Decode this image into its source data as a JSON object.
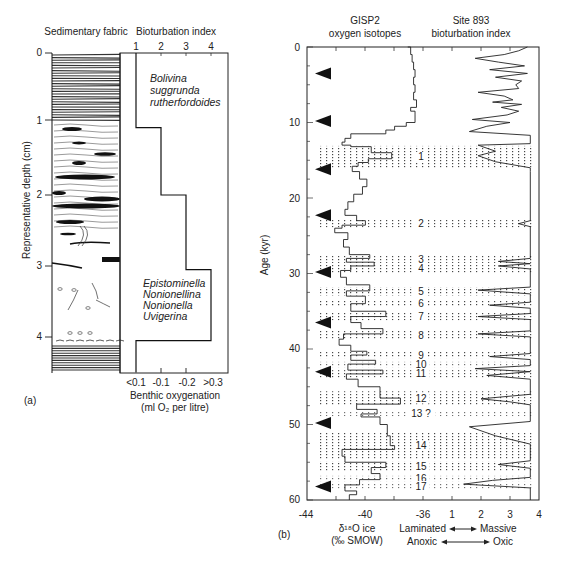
{
  "chart_data": [
    {
      "panel": "(a)",
      "type": "line",
      "columns": {
        "left_header": "Sedimentary fabric",
        "right_header": "Bioturbation index"
      },
      "ylabel": "Representative depth (cm)",
      "y_ticks": [
        "0",
        "1",
        "2",
        "3",
        "4"
      ],
      "ylim": [
        0,
        4.5
      ],
      "top_x_ticks": [
        "1",
        "2",
        "3",
        "4"
      ],
      "bottom_x_ticks": [
        "<0.1",
        "-0.1",
        "-0.2",
        ">0.3"
      ],
      "xlabel_line1": "Benthic oxygenation",
      "xlabel_line2": "(ml O₂ per litre)",
      "bioturbation_step_profile": [
        {
          "depth_from": 0.0,
          "depth_to": 1.05,
          "index": 1
        },
        {
          "depth_from": 1.05,
          "depth_to": 2.0,
          "index": 2
        },
        {
          "depth_from": 2.0,
          "depth_to": 3.05,
          "index": 3
        },
        {
          "depth_from": 3.05,
          "depth_to": 4.05,
          "index": 4
        },
        {
          "depth_from": 4.05,
          "depth_to": 4.5,
          "index": 1
        }
      ],
      "annotations": [
        {
          "text_lines": [
            "Bolivina",
            "suggrunda",
            "rutherfordoides"
          ],
          "depth": 0.4
        },
        {
          "text_lines": [
            "Epistominella",
            "Nonionellina",
            "Nonionella",
            "Uvigerina"
          ],
          "depth": 3.4
        }
      ],
      "panel_label": "(a)"
    },
    {
      "panel": "(b)",
      "type": "line",
      "series": [
        {
          "name": "GISP2 oxygen isotopes",
          "header_line1": "GISP2",
          "header_line2": "oxygen isotopes",
          "unit": "δ¹⁸O ice (‰ SMOW)"
        },
        {
          "name": "Site 893 bioturbation index",
          "header_line1": "Site 893",
          "header_line2": "bioturbation index"
        }
      ],
      "ylabel": "Age (kyr)",
      "y_ticks": [
        "0",
        "10",
        "20",
        "30",
        "40",
        "50",
        "60"
      ],
      "ylim": [
        0,
        60
      ],
      "x_ticks_isotope": [
        "-44",
        "-40",
        "-36"
      ],
      "x_ticks_bioturbation": [
        "1",
        "2",
        "3",
        "4"
      ],
      "xlabel_left_line1": "δ¹⁸O ice",
      "xlabel_left_line2": "(‰ SMOW)",
      "xlabel_right_line1_a": "Laminated",
      "xlabel_right_line1_b": "Massive",
      "xlabel_right_line2_a": "Anoxic",
      "xlabel_right_line2_b": "Oxic",
      "heinrich_arrows_kyr": [
        3.5,
        9.8,
        16.2,
        22.3,
        29.8,
        36.5,
        43.0,
        49.8,
        58.2
      ],
      "interstadial_events": [
        {
          "label": "1",
          "age_from": 13.1,
          "age_to": 16.0
        },
        {
          "label": "2",
          "age_from": 22.8,
          "age_to": 23.9
        },
        {
          "label": "3",
          "age_from": 27.6,
          "age_to": 28.6
        },
        {
          "label": "4",
          "age_from": 28.8,
          "age_to": 29.9
        },
        {
          "label": "5",
          "age_from": 31.8,
          "age_to": 32.9
        },
        {
          "label": "6",
          "age_from": 33.6,
          "age_to": 34.4
        },
        {
          "label": "7",
          "age_from": 35.1,
          "age_to": 36.2
        },
        {
          "label": "8",
          "age_from": 37.5,
          "age_to": 38.8
        },
        {
          "label": "9",
          "age_from": 40.4,
          "age_to": 41.2
        },
        {
          "label": "10",
          "age_from": 41.7,
          "age_to": 42.4
        },
        {
          "label": "11",
          "age_from": 42.8,
          "age_to": 43.8
        },
        {
          "label": "12",
          "age_from": 45.6,
          "age_to": 47.5
        },
        {
          "label": "13 ?",
          "age_from": 48.3,
          "age_to": 48.9
        },
        {
          "label": "14",
          "age_from": 51.0,
          "age_to": 54.6
        },
        {
          "label": "15",
          "age_from": 54.9,
          "age_to": 56.2
        },
        {
          "label": "16",
          "age_from": 56.8,
          "age_to": 57.5
        },
        {
          "label": "17",
          "age_from": 57.8,
          "age_to": 58.5
        }
      ],
      "isotope_curve": [
        [
          0,
          -37.1
        ],
        [
          1,
          -36.9
        ],
        [
          2,
          -36.8
        ],
        [
          3,
          -36.7
        ],
        [
          4,
          -36.6
        ],
        [
          5,
          -36.7
        ],
        [
          6,
          -36.6
        ],
        [
          7,
          -36.7
        ],
        [
          8,
          -36.5
        ],
        [
          8.5,
          -36.9
        ],
        [
          9,
          -36.6
        ],
        [
          10,
          -36.6
        ],
        [
          10.5,
          -37.2
        ],
        [
          11,
          -38.0
        ],
        [
          11.5,
          -38.6
        ],
        [
          12.1,
          -41.0
        ],
        [
          12.6,
          -41.4
        ],
        [
          13.0,
          -41.6
        ],
        [
          13.2,
          -41.0
        ],
        [
          14.0,
          -39.6
        ],
        [
          14.8,
          -38.2
        ],
        [
          15.3,
          -39.8
        ],
        [
          15.8,
          -40.5
        ],
        [
          16.5,
          -40.9
        ],
        [
          17.5,
          -40.4
        ],
        [
          18.5,
          -39.9
        ],
        [
          19.5,
          -40.2
        ],
        [
          20.5,
          -40.8
        ],
        [
          21.5,
          -41.2
        ],
        [
          22.3,
          -41.4
        ],
        [
          23.0,
          -40.6
        ],
        [
          23.6,
          -40.0
        ],
        [
          24.0,
          -41.6
        ],
        [
          24.6,
          -42.1
        ],
        [
          25.5,
          -41.2
        ],
        [
          26.5,
          -41.5
        ],
        [
          27.5,
          -41.1
        ],
        [
          28.0,
          -39.7
        ],
        [
          28.5,
          -41.3
        ],
        [
          29.0,
          -39.4
        ],
        [
          29.6,
          -41.0
        ],
        [
          30.5,
          -41.7
        ],
        [
          31.5,
          -41.3
        ],
        [
          32.3,
          -39.7
        ],
        [
          33.0,
          -41.3
        ],
        [
          34.0,
          -40.0
        ],
        [
          35.0,
          -41.0
        ],
        [
          35.7,
          -38.6
        ],
        [
          36.5,
          -41.0
        ],
        [
          37.3,
          -40.3
        ],
        [
          38.0,
          -38.8
        ],
        [
          38.7,
          -41.5
        ],
        [
          39.5,
          -41.8
        ],
        [
          40.3,
          -41.0
        ],
        [
          40.8,
          -39.9
        ],
        [
          41.5,
          -41.0
        ],
        [
          42.0,
          -39.3
        ],
        [
          42.8,
          -41.2
        ],
        [
          43.3,
          -38.8
        ],
        [
          44.0,
          -41.3
        ],
        [
          45.0,
          -40.5
        ],
        [
          46.5,
          -39.0
        ],
        [
          47.3,
          -37.6
        ],
        [
          48.0,
          -40.6
        ],
        [
          48.6,
          -39.2
        ],
        [
          49.0,
          -40.3
        ],
        [
          50.0,
          -39.0
        ],
        [
          51.5,
          -38.5
        ],
        [
          52.8,
          -38.3
        ],
        [
          53.3,
          -38.0
        ],
        [
          54.2,
          -41.6
        ],
        [
          55.0,
          -41.4
        ],
        [
          55.7,
          -38.6
        ],
        [
          56.5,
          -39.6
        ],
        [
          57.3,
          -39.0
        ],
        [
          58.0,
          -40.4
        ],
        [
          58.8,
          -41.4
        ],
        [
          59.3,
          -40.6
        ],
        [
          60.0,
          -41.1
        ]
      ],
      "bioturbation_curve": [
        [
          0,
          3.6
        ],
        [
          0.5,
          3.3
        ],
        [
          1.0,
          2.8
        ],
        [
          1.5,
          1.8
        ],
        [
          2.0,
          2.6
        ],
        [
          2.5,
          3.5
        ],
        [
          3.0,
          2.3
        ],
        [
          3.5,
          3.6
        ],
        [
          4.0,
          2.5
        ],
        [
          4.5,
          3.4
        ],
        [
          5.0,
          3.2
        ],
        [
          5.5,
          3.3
        ],
        [
          6.0,
          1.9
        ],
        [
          6.5,
          2.8
        ],
        [
          7.0,
          3.1
        ],
        [
          7.3,
          2.4
        ],
        [
          7.6,
          3.4
        ],
        [
          8.0,
          2.7
        ],
        [
          8.5,
          3.3
        ],
        [
          9.0,
          2.9
        ],
        [
          9.6,
          1.7
        ],
        [
          10.0,
          3.0
        ],
        [
          10.5,
          2.2
        ],
        [
          11.2,
          1.6
        ],
        [
          11.7,
          3.7
        ],
        [
          12.8,
          3.7
        ],
        [
          13.0,
          1.9
        ],
        [
          13.8,
          2.5
        ],
        [
          14.4,
          1.9
        ],
        [
          15.2,
          2.5
        ],
        [
          16.0,
          3.7
        ],
        [
          16.5,
          3.7
        ],
        [
          23.0,
          3.7
        ],
        [
          23.4,
          3.3
        ],
        [
          23.8,
          3.7
        ],
        [
          28.0,
          3.7
        ],
        [
          28.4,
          2.6
        ],
        [
          28.7,
          3.7
        ],
        [
          29.0,
          2.6
        ],
        [
          29.4,
          3.7
        ],
        [
          31.8,
          3.7
        ],
        [
          32.2,
          1.9
        ],
        [
          32.7,
          3.7
        ],
        [
          33.8,
          3.7
        ],
        [
          34.2,
          2.3
        ],
        [
          34.6,
          3.7
        ],
        [
          35.3,
          3.7
        ],
        [
          35.7,
          1.9
        ],
        [
          36.1,
          3.7
        ],
        [
          37.6,
          3.7
        ],
        [
          38.0,
          1.9
        ],
        [
          38.4,
          3.7
        ],
        [
          40.6,
          3.7
        ],
        [
          41.0,
          2.3
        ],
        [
          41.4,
          3.7
        ],
        [
          42.2,
          3.7
        ],
        [
          42.6,
          1.8
        ],
        [
          43.0,
          3.7
        ],
        [
          43.5,
          2.2
        ],
        [
          44.0,
          3.7
        ],
        [
          46.0,
          3.7
        ],
        [
          46.6,
          2.0
        ],
        [
          47.0,
          3.0
        ],
        [
          47.4,
          3.7
        ],
        [
          49.6,
          3.7
        ],
        [
          50.3,
          1.6
        ],
        [
          51.5,
          2.5
        ],
        [
          52.6,
          3.7
        ],
        [
          54.8,
          3.7
        ],
        [
          55.3,
          2.6
        ],
        [
          55.8,
          3.7
        ],
        [
          57.0,
          3.7
        ],
        [
          57.4,
          2.4
        ],
        [
          57.9,
          1.4
        ],
        [
          58.4,
          3.7
        ],
        [
          60.0,
          3.7
        ]
      ],
      "panel_label": "(b)"
    }
  ]
}
